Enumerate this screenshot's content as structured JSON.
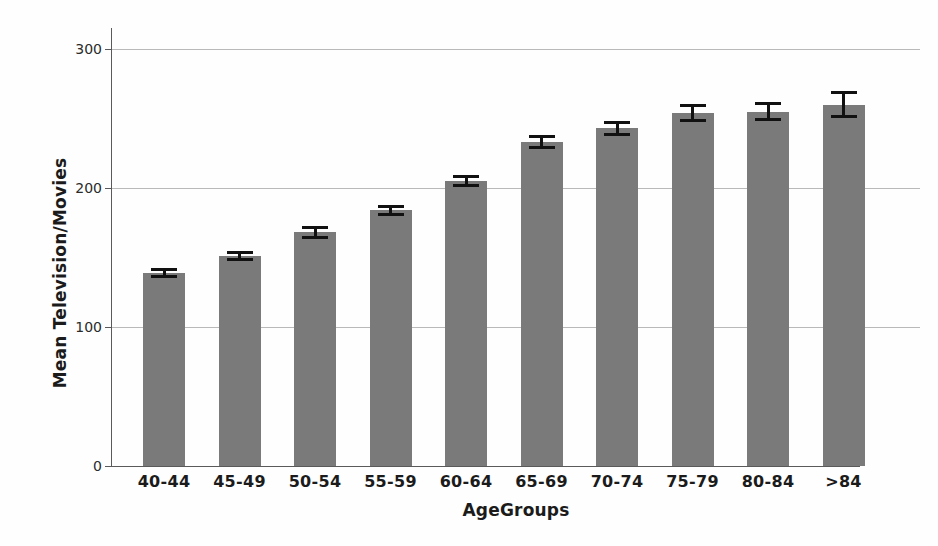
{
  "chart_data": {
    "type": "bar",
    "title": "",
    "xlabel": "AgeGroups",
    "ylabel": "Mean Television/Movies",
    "categories": [
      "40-44",
      "45-49",
      "50-54",
      "55-59",
      "60-64",
      "65-69",
      "70-74",
      "75-79",
      "80-84",
      ">84"
    ],
    "values": [
      139,
      151,
      168,
      184,
      205,
      233,
      243,
      254,
      255,
      260
    ],
    "errors": [
      3.5,
      3.5,
      4.5,
      4.0,
      4.5,
      5.0,
      5.5,
      6.5,
      7.0,
      9.5
    ],
    "ylim": [
      0,
      300
    ],
    "yticks": [
      0,
      100,
      200,
      300
    ],
    "ytick_labels": [
      "0",
      "100",
      "200",
      "300"
    ],
    "grid": true,
    "legend": false,
    "bar_color": "#7a7a7a",
    "error_color": "#111111",
    "grid_color": "#b9b9b9",
    "axis_color": "#5a5a5a"
  }
}
